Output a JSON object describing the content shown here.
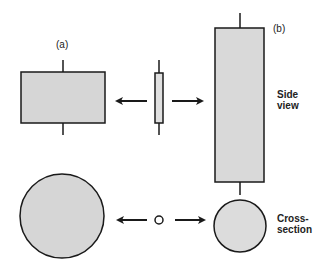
{
  "diagram": {
    "labels": {
      "a": "(a)",
      "b": "(b)",
      "side_view_line1": "Side",
      "side_view_line2": "view",
      "cross_section_line1": "Cross-",
      "cross_section_line2": "section"
    },
    "colors": {
      "fill": "#d6d6d6",
      "stroke": "#1a1a1a",
      "background": "#ffffff"
    }
  }
}
